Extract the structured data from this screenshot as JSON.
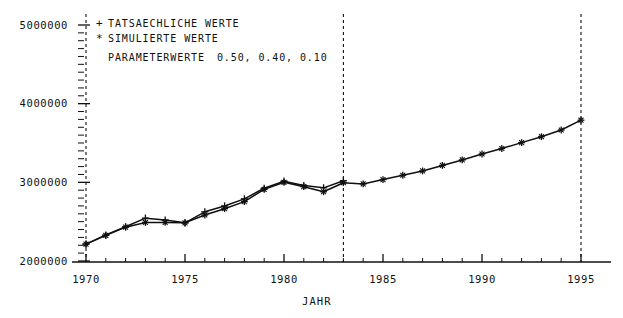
{
  "chart_data": {
    "type": "line",
    "title": "",
    "subtitle": "",
    "xlabel": "JAHR",
    "ylabel": "",
    "xlim": [
      1970,
      1995
    ],
    "ylim": [
      2000000,
      5000000
    ],
    "grid": false,
    "legend_position": "top-left",
    "x": [
      1970,
      1971,
      1972,
      1973,
      1974,
      1975,
      1976,
      1977,
      1978,
      1979,
      1980,
      1981,
      1982,
      1983,
      1984,
      1985,
      1986,
      1987,
      1988,
      1989,
      1990,
      1991,
      1992,
      1993,
      1994,
      1995
    ],
    "xticks": [
      1970,
      1975,
      1980,
      1985,
      1990,
      1995
    ],
    "xticklabels": [
      "1970",
      "1975",
      "1980",
      "1985",
      "1990",
      "1995"
    ],
    "xminor_tick_step": 1,
    "yticks": [
      2000000,
      3000000,
      4000000,
      5000000
    ],
    "yticklabels": [
      "2000000",
      "3000000",
      "4000000",
      "5000000"
    ],
    "yminor_tick_step": 100000,
    "vertical_reference_lines": [
      1970,
      1983,
      1995
    ],
    "series": [
      {
        "name": "TATSAECHLICHE WERTE",
        "marker": "+",
        "values": [
          2215000,
          2330000,
          2435000,
          2545000,
          2520000,
          2485000,
          2625000,
          2700000,
          2790000,
          2925000,
          3015000,
          2960000,
          2930000,
          3020000,
          null,
          null,
          null,
          null,
          null,
          null,
          null,
          null,
          null,
          null,
          null,
          null
        ]
      },
      {
        "name": "SIMULIERTE WERTE",
        "marker": "*",
        "values": [
          2215000,
          2325000,
          2430000,
          2490000,
          2490000,
          2485000,
          2585000,
          2665000,
          2755000,
          2910000,
          3000000,
          2945000,
          2880000,
          2995000,
          2980000,
          3035000,
          3090000,
          3145000,
          3215000,
          3285000,
          3360000,
          3430000,
          3505000,
          3580000,
          3665000,
          3790000
        ]
      }
    ],
    "annotations": [
      "PARAMETERWERTE   0.50, 0.40, 0.10"
    ]
  },
  "legend": {
    "entries": [
      {
        "marker": "+",
        "label": "TATSAECHLICHE WERTE"
      },
      {
        "marker": "*",
        "label": "SIMULIERTE WERTE"
      }
    ],
    "parameters_label": "PARAMETERWERTE",
    "parameters_values": "0.50, 0.40, 0.10"
  },
  "axes": {
    "x_title": "JAHR",
    "x_labels": [
      "1970",
      "1975",
      "1980",
      "1985",
      "1990",
      "1995"
    ],
    "y_labels": [
      "5000000",
      "4000000",
      "3000000",
      "2000000"
    ]
  },
  "colors": {
    "ink": "#101010",
    "background": "#ffffff"
  }
}
